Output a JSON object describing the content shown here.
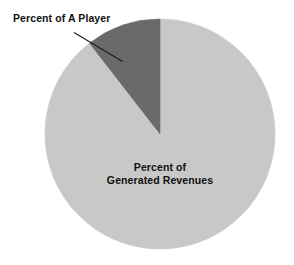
{
  "chart_data": {
    "type": "pie",
    "title": "",
    "subtitle": "",
    "xlabel": "",
    "ylabel": "",
    "legend_position": "none",
    "grid": false,
    "start_angle_deg": 0,
    "direction": "counterclockwise",
    "categories": [
      "Percent of A Player",
      "Percent of Generated Revenues"
    ],
    "values": [
      10.5,
      89.5
    ],
    "units": "percent",
    "slices": [
      {
        "label": "Percent of A Player",
        "value": 10.5,
        "color": "#6a6a6a",
        "label_placement": "outside-callout",
        "sweep_deg": 38
      },
      {
        "label": "Percent of Generated Revenues",
        "value": 89.5,
        "color": "#c8c8c8",
        "label_placement": "inside",
        "sweep_deg": 322
      }
    ]
  },
  "labels": {
    "callout": "Percent of A Player",
    "inner_line1": "Percent of",
    "inner_line2": "Generated Revenues"
  },
  "colors": {
    "background": "#ffffff",
    "slice_dark": "#6a6a6a",
    "slice_light": "#c8c8c8",
    "leader_line": "#1a1a1a",
    "text": "#101010"
  }
}
